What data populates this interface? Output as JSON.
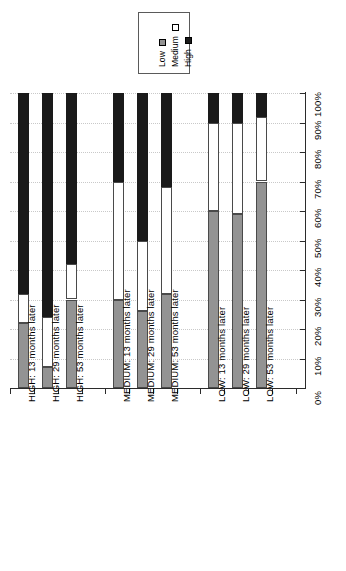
{
  "legend": {
    "items": [
      {
        "label": "Low",
        "color": "#939393",
        "swatch": "legend-swatch-low"
      },
      {
        "label": "Medium",
        "color": "#ffffff",
        "swatch": "legend-swatch-medium"
      },
      {
        "label": "High",
        "color": "#1a1a1a",
        "swatch": "legend-swatch-high"
      }
    ]
  },
  "chart_data": {
    "type": "bar",
    "subtype": "stacked-percent",
    "orientation": "rotated-90-ccw",
    "title": "",
    "subtitle": "",
    "xlabel": "",
    "ylabel": "",
    "ylim": [
      0,
      100
    ],
    "grid": true,
    "legend_position": "top-center",
    "categories": [
      "HIGH: 13 months later",
      "HIGH: 29 months later",
      "HIGH: 53 months later",
      "MEDIUM: 13 months later",
      "MEDIUM: 29 months later",
      "MEDIUM: 53 months later",
      "LOW: 13 months later",
      "LOW: 29 months later",
      "LOW: 53 months later"
    ],
    "tick_labels": [
      "0%",
      "10%",
      "20%",
      "30%",
      "40%",
      "50%",
      "60%",
      "70%",
      "80%",
      "90%",
      "100%"
    ],
    "tick_values": [
      0,
      10,
      20,
      30,
      40,
      50,
      60,
      70,
      80,
      90,
      100
    ],
    "series": [
      {
        "name": "Low",
        "color": "#939393",
        "values": [
          22,
          7,
          30,
          30,
          26,
          32,
          60,
          59,
          70
        ]
      },
      {
        "name": "Medium",
        "color": "#ffffff",
        "values": [
          10,
          17,
          12,
          40,
          24,
          36,
          30,
          31,
          22
        ]
      },
      {
        "name": "High",
        "color": "#1a1a1a",
        "values": [
          68,
          76,
          58,
          30,
          50,
          32,
          10,
          10,
          8
        ]
      }
    ]
  }
}
